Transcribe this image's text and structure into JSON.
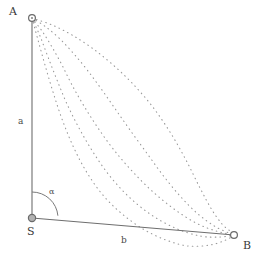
{
  "figure": {
    "type": "geometry-diagram",
    "background_color": "#ffffff",
    "line_color": "#6e6e6e",
    "curve_color": "#9a9a9a",
    "text_color": "#3a3a3a"
  },
  "labels": {
    "vertex_a": "A",
    "vertex_s": "S",
    "vertex_b": "B",
    "side_a": "a",
    "side_b": "b",
    "angle_alpha": "α"
  },
  "points": {
    "A": {
      "x": 32,
      "y": 18,
      "marker": "open-circle"
    },
    "S": {
      "x": 32,
      "y": 218,
      "marker": "filled-circle"
    },
    "B": {
      "x": 234,
      "y": 235,
      "marker": "open-circle"
    }
  },
  "segments": [
    {
      "name": "side-a",
      "from": "A",
      "to": "S",
      "label": "a",
      "style": "solid"
    },
    {
      "name": "side-b",
      "from": "S",
      "to": "B",
      "label": "b",
      "style": "solid"
    }
  ],
  "angle_arc": {
    "vertex": "S",
    "label": "α",
    "radius": 26,
    "from_deg": 90,
    "to_deg": 5
  },
  "chart_data": {
    "type": "line",
    "title": "",
    "xlabel": "b",
    "ylabel": "a",
    "grid": false,
    "legend": null,
    "xlim": [
      32,
      234
    ],
    "ylim": [
      18,
      250
    ],
    "annotations": [
      "A",
      "S",
      "B",
      "a",
      "b",
      "α"
    ],
    "series": [
      {
        "name": "curve-1-outer-upper",
        "style": "dotted",
        "points": [
          [
            32,
            18
          ],
          [
            52,
            25
          ],
          [
            72,
            35
          ],
          [
            92,
            48
          ],
          [
            112,
            64
          ],
          [
            132,
            83
          ],
          [
            152,
            106
          ],
          [
            170,
            132
          ],
          [
            186,
            160
          ],
          [
            200,
            188
          ],
          [
            212,
            210
          ],
          [
            222,
            224
          ],
          [
            230,
            231
          ],
          [
            234,
            235
          ]
        ]
      },
      {
        "name": "curve-2",
        "style": "dotted",
        "points": [
          [
            32,
            18
          ],
          [
            46,
            27
          ],
          [
            60,
            39
          ],
          [
            74,
            54
          ],
          [
            88,
            71
          ],
          [
            102,
            90
          ],
          [
            116,
            110
          ],
          [
            130,
            130
          ],
          [
            146,
            152
          ],
          [
            162,
            174
          ],
          [
            180,
            196
          ],
          [
            198,
            214
          ],
          [
            216,
            227
          ],
          [
            234,
            235
          ]
        ]
      },
      {
        "name": "curve-3",
        "style": "dotted",
        "points": [
          [
            32,
            18
          ],
          [
            42,
            31
          ],
          [
            52,
            47
          ],
          [
            62,
            65
          ],
          [
            72,
            85
          ],
          [
            84,
            106
          ],
          [
            98,
            128
          ],
          [
            114,
            150
          ],
          [
            132,
            171
          ],
          [
            152,
            191
          ],
          [
            174,
            209
          ],
          [
            196,
            223
          ],
          [
            216,
            231
          ],
          [
            234,
            235
          ]
        ]
      },
      {
        "name": "curve-4",
        "style": "dotted",
        "points": [
          [
            32,
            18
          ],
          [
            40,
            36
          ],
          [
            48,
            57
          ],
          [
            57,
            80
          ],
          [
            67,
            104
          ],
          [
            79,
            128
          ],
          [
            93,
            152
          ],
          [
            109,
            175
          ],
          [
            128,
            196
          ],
          [
            150,
            214
          ],
          [
            175,
            228
          ],
          [
            200,
            236
          ],
          [
            220,
            237
          ],
          [
            234,
            235
          ]
        ]
      },
      {
        "name": "curve-5-brachistochrone-dip",
        "style": "dotted",
        "points": [
          [
            32,
            18
          ],
          [
            38,
            40
          ],
          [
            45,
            65
          ],
          [
            53,
            92
          ],
          [
            62,
            119
          ],
          [
            73,
            146
          ],
          [
            86,
            171
          ],
          [
            102,
            194
          ],
          [
            121,
            213
          ],
          [
            143,
            229
          ],
          [
            166,
            240
          ],
          [
            188,
            246
          ],
          [
            210,
            245
          ],
          [
            226,
            240
          ],
          [
            234,
            235
          ]
        ]
      }
    ]
  }
}
